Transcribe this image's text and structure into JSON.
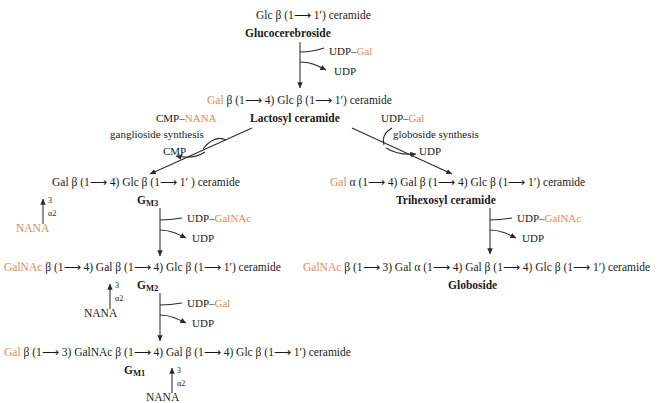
{
  "diagram": {
    "accent_color": "#e0895a",
    "text_color": "#1a1a1a"
  },
  "arrow": "⟶",
  "branch_labels": {
    "ganglioside": "ganglioside synthesis",
    "globoside": "globoside synthesis"
  },
  "cofactors": {
    "udp_gal_in_1": "UDP–",
    "udp_gal_in_1_accent": "Gal",
    "udp_out_1": "UDP",
    "cmp_nana_in": "CMP–",
    "cmp_nana_in_accent": "NANA",
    "cmp_out": "CMP",
    "udp_gal_in_2": "UDP–",
    "udp_gal_in_2_accent": "Gal",
    "udp_out_2": "UDP",
    "udp_galnac_in_left": "UDP–",
    "udp_galnac_in_left_accent": "GalNAc",
    "udp_out_left_gm2": "UDP",
    "udp_gal_in_left_gm1": "UDP–",
    "udp_gal_in_left_gm1_accent": "Gal",
    "udp_out_left_gm1": "UDP",
    "udp_galnac_in_right": "UDP–",
    "udp_galnac_in_right_accent": "GalNAc",
    "udp_out_right": "UDP"
  },
  "species": {
    "glucocerebroside": {
      "name": "Glucocerebroside",
      "parts": [
        {
          "t": "Glc β (1",
          "c": "black"
        },
        {
          "t": "⟶",
          "c": "arrow"
        },
        {
          "t": " 1′) ceramide",
          "c": "black"
        }
      ]
    },
    "lactosyl_ceramide": {
      "name": "Lactosyl ceramide",
      "parts": [
        {
          "t": "Gal",
          "c": "orange"
        },
        {
          "t": " β (1",
          "c": "black"
        },
        {
          "t": "⟶",
          "c": "arrow"
        },
        {
          "t": " 4) Glc β (1",
          "c": "black"
        },
        {
          "t": "⟶",
          "c": "arrow"
        },
        {
          "t": " 1′) ceramide",
          "c": "black"
        }
      ]
    },
    "gm3": {
      "name": "G",
      "name_sub": "M3",
      "parts": [
        {
          "t": "Gal β (1",
          "c": "black"
        },
        {
          "t": "⟶",
          "c": "arrow"
        },
        {
          "t": " 4) Glc β (1",
          "c": "black"
        },
        {
          "t": "⟶",
          "c": "arrow"
        },
        {
          "t": " 1′ ) ceramide",
          "c": "black"
        }
      ],
      "branch": {
        "position": "3",
        "linkage": "α2",
        "residue": "NANA",
        "residue_color": "orange"
      }
    },
    "gm2": {
      "name": "G",
      "name_sub": "M2",
      "parts": [
        {
          "t": "GalNAc",
          "c": "orange"
        },
        {
          "t": " β (1",
          "c": "black"
        },
        {
          "t": "⟶",
          "c": "arrow"
        },
        {
          "t": " 4) Gal β (1",
          "c": "black"
        },
        {
          "t": "⟶",
          "c": "arrow"
        },
        {
          "t": " 4) Glc β (1",
          "c": "black"
        },
        {
          "t": "⟶",
          "c": "arrow"
        },
        {
          "t": " 1′) ceramide",
          "c": "black"
        }
      ],
      "branch": {
        "position": "3",
        "linkage": "α2",
        "residue": "NANA",
        "residue_color": "black"
      }
    },
    "gm1": {
      "name": "G",
      "name_sub": "M1",
      "parts": [
        {
          "t": "Gal",
          "c": "orange"
        },
        {
          "t": " β (1",
          "c": "black"
        },
        {
          "t": "⟶",
          "c": "arrow"
        },
        {
          "t": " 3) GalNAc β (1",
          "c": "black"
        },
        {
          "t": "⟶",
          "c": "arrow"
        },
        {
          "t": " 4) Gal β (1",
          "c": "black"
        },
        {
          "t": "⟶",
          "c": "arrow"
        },
        {
          "t": " 4) Glc β (1",
          "c": "black"
        },
        {
          "t": "⟶",
          "c": "arrow"
        },
        {
          "t": " 1′) ceramide",
          "c": "black"
        }
      ],
      "branch": {
        "position": "3",
        "linkage": "α2",
        "residue": "NANA",
        "residue_color": "black"
      }
    },
    "trihexosyl_ceramide": {
      "name": "Trihexosyl ceramide",
      "parts": [
        {
          "t": "Gal",
          "c": "orange"
        },
        {
          "t": " α (1",
          "c": "black"
        },
        {
          "t": "⟶",
          "c": "arrow"
        },
        {
          "t": " 4) Gal β (1",
          "c": "black"
        },
        {
          "t": "⟶",
          "c": "arrow"
        },
        {
          "t": " 4) Glc β (1",
          "c": "black"
        },
        {
          "t": "⟶",
          "c": "arrow"
        },
        {
          "t": " 1′) ceramide",
          "c": "black"
        }
      ]
    },
    "globoside": {
      "name": "Globoside",
      "parts": [
        {
          "t": "GalNAc",
          "c": "orange"
        },
        {
          "t": " β (1",
          "c": "black"
        },
        {
          "t": "⟶",
          "c": "arrow"
        },
        {
          "t": " 3) Gal α (1",
          "c": "black"
        },
        {
          "t": "⟶",
          "c": "arrow"
        },
        {
          "t": " 4) Gal β (1",
          "c": "black"
        },
        {
          "t": "⟶",
          "c": "arrow"
        },
        {
          "t": " 4) Glc β (1",
          "c": "black"
        },
        {
          "t": "⟶",
          "c": "arrow"
        },
        {
          "t": " 1′) ceramide",
          "c": "black"
        }
      ]
    }
  }
}
